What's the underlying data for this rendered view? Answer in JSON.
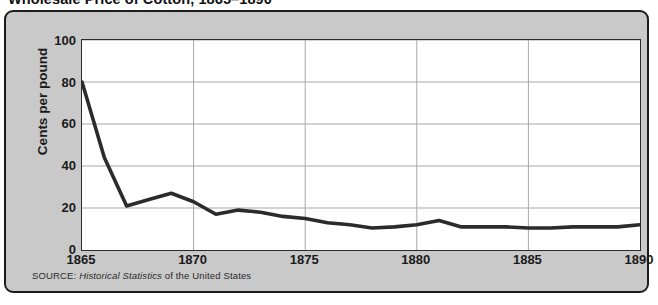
{
  "figure": {
    "title": "Wholesale Price of Cotton, 1865–1890",
    "source_label": "SOURCE:",
    "source_italic": "Historical Statistics",
    "source_rest": "of the United States",
    "panel_bg": "#c9c9c9",
    "panel_border": "#1c1c1c",
    "plot_bg": "#ffffff",
    "line_color": "#2b2b2b",
    "grid_color": "#a8a8a8"
  },
  "axes": {
    "y_title": "Cents per pound",
    "y_ticks": [
      "0",
      "20",
      "40",
      "60",
      "80",
      "100"
    ],
    "x_ticks": [
      "1865",
      "1870",
      "1875",
      "1880",
      "1885",
      "1890"
    ]
  },
  "chart_data": {
    "type": "line",
    "title": "Wholesale Price of Cotton, 1865–1890",
    "xlabel": "",
    "ylabel": "Cents per pound",
    "xlim": [
      1865,
      1890
    ],
    "ylim": [
      0,
      100
    ],
    "grid": true,
    "legend": "none",
    "x": [
      1865,
      1866,
      1867,
      1868,
      1869,
      1870,
      1871,
      1872,
      1873,
      1874,
      1875,
      1876,
      1877,
      1878,
      1879,
      1880,
      1881,
      1882,
      1883,
      1884,
      1885,
      1886,
      1887,
      1888,
      1889,
      1890
    ],
    "series": [
      {
        "name": "Wholesale price of cotton",
        "values": [
          80,
          44,
          21,
          24,
          27,
          23,
          17,
          19,
          18,
          16,
          15,
          13,
          12,
          10.5,
          11,
          12,
          14,
          11,
          11,
          11,
          10.5,
          10.5,
          11,
          11,
          11,
          12
        ]
      }
    ],
    "tick_values_y": [
      0,
      20,
      40,
      60,
      80,
      100
    ],
    "tick_values_x": [
      1865,
      1870,
      1875,
      1880,
      1885,
      1890
    ],
    "source": "SOURCE: Historical Statistics of the United States"
  }
}
